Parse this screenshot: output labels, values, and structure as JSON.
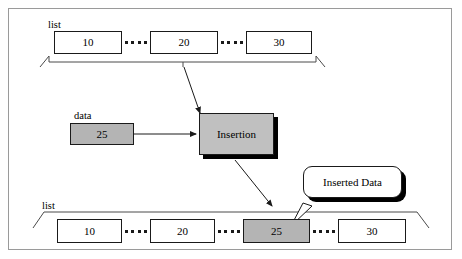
{
  "diagram": {
    "frame_color": "#9a9a9a",
    "fill_gray": "#b4b4b4",
    "shadow_color": "#000000",
    "top_list": {
      "label": "list",
      "nodes": [
        {
          "value": "10",
          "filled": false
        },
        {
          "value": "20",
          "filled": false
        },
        {
          "value": "30",
          "filled": false
        }
      ]
    },
    "data_input": {
      "label": "data",
      "value": "25",
      "filled": true
    },
    "process": {
      "label": "Insertion"
    },
    "callout": {
      "label": "Inserted Data"
    },
    "bottom_list": {
      "label": "list",
      "nodes": [
        {
          "value": "10",
          "filled": false
        },
        {
          "value": "20",
          "filled": false
        },
        {
          "value": "25",
          "filled": true
        },
        {
          "value": "30",
          "filled": false
        }
      ]
    },
    "arrows": [
      {
        "name": "list-to-insertion"
      },
      {
        "name": "data-to-insertion"
      },
      {
        "name": "insertion-to-list"
      }
    ]
  }
}
